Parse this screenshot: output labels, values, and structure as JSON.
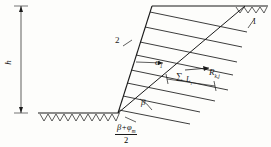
{
  "figure": {
    "line_color": "#1a1a1a",
    "background_color": "#fdfdfb"
  },
  "labels": {
    "height_symbol": "h",
    "callout_1": "1",
    "callout_2": "2",
    "nail_inclination": "α",
    "nail_inclination_sub": "1",
    "slope_angle": "β",
    "nail_force": "R",
    "nail_force_sub": "k,j",
    "bond_length": "L",
    "bond_length_sub": "i",
    "sum_symbol": "∑"
  },
  "formula": {
    "numerator": "β+φ",
    "numerator_sub": "m",
    "denominator": "2"
  },
  "geometry": {
    "ground_left_y": 113,
    "slope_toe_x": 118,
    "slope_crest_x": 152,
    "slope_crest_y": 6,
    "nail_count": 8,
    "dimension_line_x": 21
  }
}
